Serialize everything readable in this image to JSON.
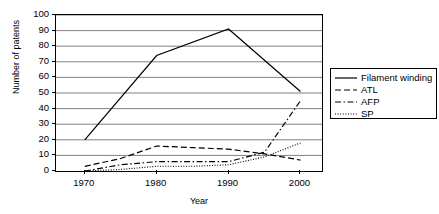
{
  "chart_data": {
    "type": "line",
    "title": "",
    "xlabel": "Year",
    "ylabel": "Number of patents",
    "x": [
      1970,
      1975,
      1980,
      1985,
      1990,
      1995,
      2000
    ],
    "xlim": [
      1966,
      2003
    ],
    "ylim": [
      0,
      100
    ],
    "ytick_labels": [
      "100",
      "90",
      "80",
      "70",
      "60",
      "50",
      "40",
      "30",
      "20",
      "10",
      "0"
    ],
    "yticks": [
      100,
      90,
      80,
      70,
      60,
      50,
      40,
      30,
      20,
      10,
      0
    ],
    "xtick_labels": [
      "1970",
      "1980",
      "1990",
      "2000"
    ],
    "xticks": [
      1970,
      1980,
      1990,
      2000
    ],
    "grid": "horizontal",
    "legend_position": "right-outside",
    "series": [
      {
        "name": "Filament winding",
        "style": "solid",
        "points": [
          [
            1970,
            20
          ],
          [
            1980,
            74
          ],
          [
            1990,
            91
          ],
          [
            2000,
            51
          ]
        ]
      },
      {
        "name": "ATL",
        "style": "dashed",
        "points": [
          [
            1970,
            3
          ],
          [
            1975,
            8
          ],
          [
            1980,
            16
          ],
          [
            1985,
            15
          ],
          [
            1990,
            14
          ],
          [
            1995,
            11
          ],
          [
            2000,
            7
          ]
        ]
      },
      {
        "name": "AFP",
        "style": "dash-dot",
        "points": [
          [
            1970,
            0
          ],
          [
            1975,
            4
          ],
          [
            1980,
            6
          ],
          [
            1985,
            6
          ],
          [
            1990,
            6
          ],
          [
            1995,
            12
          ],
          [
            2000,
            45
          ]
        ]
      },
      {
        "name": "SP",
        "style": "dotted",
        "points": [
          [
            1970,
            0
          ],
          [
            1975,
            1
          ],
          [
            1980,
            3
          ],
          [
            1985,
            3
          ],
          [
            1990,
            4
          ],
          [
            1995,
            9
          ],
          [
            2000,
            18
          ]
        ]
      }
    ],
    "colors": {
      "line": "#000000",
      "grid": "#808080",
      "frame": "#000000",
      "background": "#ffffff"
    }
  },
  "legend": {
    "items": [
      {
        "label": "Filament winding"
      },
      {
        "label": "ATL"
      },
      {
        "label": "AFP"
      },
      {
        "label": "SP"
      }
    ]
  }
}
